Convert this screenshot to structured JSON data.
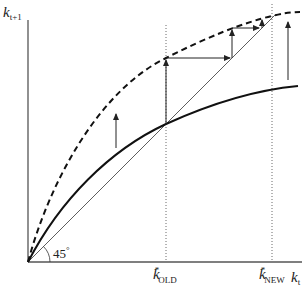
{
  "diagram": {
    "type": "solow-growth-diagram",
    "y_axis_label": {
      "var": "k",
      "sub": "t+1"
    },
    "x_axis_label": {
      "var": "k",
      "sub": "t"
    },
    "angle_label": "45°",
    "angle_deg": "45",
    "angle_sup": "°",
    "steady_states": [
      {
        "var": "k",
        "sup": "*",
        "sub": "OLD"
      },
      {
        "var": "k",
        "sup": "*",
        "sub": "NEW"
      }
    ],
    "curves": [
      {
        "name": "old-capital-accumulation-curve",
        "style": "solid-thick"
      },
      {
        "name": "new-capital-accumulation-curve",
        "style": "dashed-thick"
      },
      {
        "name": "45-degree-line",
        "style": "solid-thin"
      }
    ],
    "arrows": [
      {
        "name": "shift-up-arrow-left",
        "direction": "up"
      },
      {
        "name": "shift-up-arrow-right",
        "direction": "up"
      },
      {
        "name": "transition-staircase",
        "direction": "up-right"
      }
    ]
  }
}
